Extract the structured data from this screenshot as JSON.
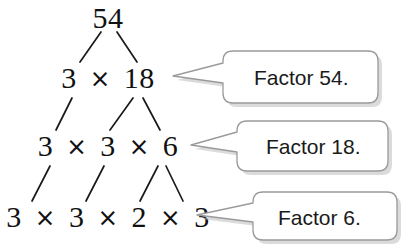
{
  "figure": {
    "background_color": "#ffffff",
    "text_color": "#111111"
  },
  "tree": {
    "operator": "×",
    "rows": [
      {
        "id": "root",
        "label": "54",
        "terms": [
          "54"
        ]
      },
      {
        "id": "level1",
        "label": "3 × 18",
        "terms": [
          "3",
          "18"
        ]
      },
      {
        "id": "level2",
        "label": "3 × 3 × 6",
        "terms": [
          "3",
          "3",
          "6"
        ]
      },
      {
        "id": "level3",
        "label": "3 × 3 × 2 × 3",
        "terms": [
          "3",
          "3",
          "2",
          "3"
        ]
      }
    ],
    "root_value": "54",
    "prime_factorization": "3 × 3 × 2 × 3"
  },
  "callouts": [
    {
      "id": "callout-54",
      "text": "Factor 54.",
      "points_to": "3 × 18"
    },
    {
      "id": "callout-18",
      "text": "Factor 18.",
      "points_to": "3 × 3 × 6"
    },
    {
      "id": "callout-6",
      "text": "Factor 6.",
      "points_to": "3 × 3 × 2 × 3"
    }
  ],
  "style": {
    "bubble_fill": "#ffffff",
    "bubble_border": "#9a9a9a",
    "bubble_shadow": "#b5b5b5",
    "line_color": "#1a1a1a"
  }
}
